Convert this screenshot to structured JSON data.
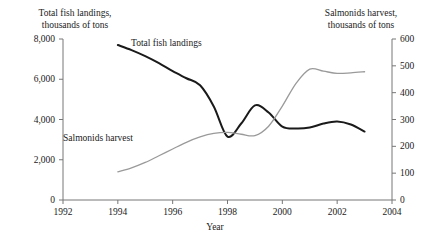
{
  "chart_data": {
    "type": "line",
    "title": "",
    "xlabel": "Year",
    "x_ticks": [
      "1992",
      "1994",
      "1996",
      "1998",
      "2000",
      "2002",
      "2004"
    ],
    "xlim": [
      1992,
      2004
    ],
    "grid": false,
    "legend_position": "inline-labels",
    "axes": {
      "left": {
        "label_line1": "Total fish landings,",
        "label_line2": "thousands of tons",
        "ticks": [
          "0",
          "2,000",
          "4,000",
          "6,000",
          "8,000"
        ],
        "tick_values": [
          0,
          2000,
          4000,
          6000,
          8000
        ],
        "ylim": [
          0,
          8000
        ]
      },
      "right": {
        "label_line1": "Salmonids harvest,",
        "label_line2": "thousands of tons",
        "ticks": [
          "0",
          "100",
          "200",
          "300",
          "400",
          "500",
          "600"
        ],
        "tick_values": [
          0,
          100,
          200,
          300,
          400,
          500,
          600
        ],
        "ylim": [
          0,
          600
        ]
      }
    },
    "series": [
      {
        "name": "Total fish landings",
        "inline_label": "Total fish landings",
        "axis": "left",
        "color": "#1a1a1a",
        "line_width": 2.0,
        "x": [
          1994,
          1994.5,
          1995,
          1995.5,
          1996,
          1996.5,
          1997,
          1997.5,
          1998,
          1998.5,
          1999,
          1999.5,
          2000,
          2000.5,
          2001,
          2001.5,
          2002,
          2002.5,
          2003
        ],
        "values": [
          7700,
          7450,
          7150,
          6800,
          6400,
          6050,
          5700,
          4650,
          3150,
          3800,
          4700,
          4350,
          3650,
          3550,
          3600,
          3800,
          3900,
          3750,
          3400
        ]
      },
      {
        "name": "Salmonids harvest",
        "inline_label": "Salmonids harvest",
        "axis": "right",
        "color": "#9a9a9a",
        "line_width": 1.3,
        "x": [
          1994,
          1994.5,
          1995,
          1995.5,
          1996,
          1996.5,
          1997,
          1997.5,
          1998,
          1998.5,
          1999,
          1999.5,
          2000,
          2000.5,
          2001,
          2001.5,
          2002,
          2002.5,
          2003
        ],
        "values": [
          105,
          120,
          140,
          165,
          190,
          215,
          235,
          248,
          252,
          245,
          240,
          275,
          350,
          435,
          488,
          480,
          472,
          474,
          478
        ]
      }
    ]
  }
}
